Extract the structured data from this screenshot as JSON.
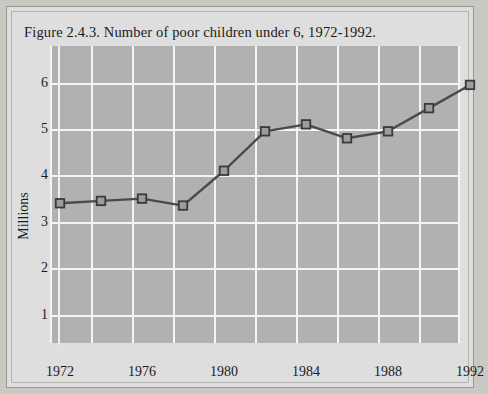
{
  "figure": {
    "title": "Figure 2.4.3. Number of poor children under 6, 1972-1992."
  },
  "chart_data": {
    "type": "line",
    "title": "Figure 2.4.3. Number of poor children under 6, 1972-1992.",
    "xlabel": "",
    "ylabel": "Millions",
    "x": [
      1972,
      1974,
      1976,
      1978,
      1980,
      1982,
      1984,
      1986,
      1988,
      1990,
      1992
    ],
    "values": [
      3.4,
      3.45,
      3.5,
      3.35,
      4.1,
      4.95,
      5.1,
      4.8,
      4.95,
      5.45,
      5.95
    ],
    "series": [
      {
        "name": "Number of poor children under 6 (millions)",
        "values": [
          3.4,
          3.45,
          3.5,
          3.35,
          4.1,
          4.95,
          5.1,
          4.8,
          4.95,
          5.45,
          5.95
        ]
      }
    ],
    "xlim": [
      1972,
      1992
    ],
    "ylim": [
      0,
      6.4
    ],
    "x_tick_labels": [
      "1972",
      "1976",
      "1980",
      "1984",
      "1988",
      "1992"
    ],
    "x_tick_values": [
      1972,
      1976,
      1980,
      1984,
      1988,
      1992
    ],
    "x_gridline_values": [
      1972,
      1974,
      1976,
      1978,
      1980,
      1982,
      1984,
      1986,
      1988,
      1990,
      1992
    ],
    "y_tick_labels": [
      "1",
      "2",
      "3",
      "4",
      "5",
      "6"
    ],
    "y_tick_values": [
      1,
      2,
      3,
      4,
      5,
      6
    ],
    "grid": true,
    "legend": "none",
    "marker": "square",
    "colors": {
      "line": "#4a4a4a",
      "marker_fill": "#9d9d9d",
      "marker_edge": "#3a3a3a",
      "plot_background": "#b1b1b1",
      "gridline": "#f4f4f4",
      "page_background": "#dedede",
      "frame": "#9a9a95",
      "text": "#1b1b1b"
    }
  }
}
